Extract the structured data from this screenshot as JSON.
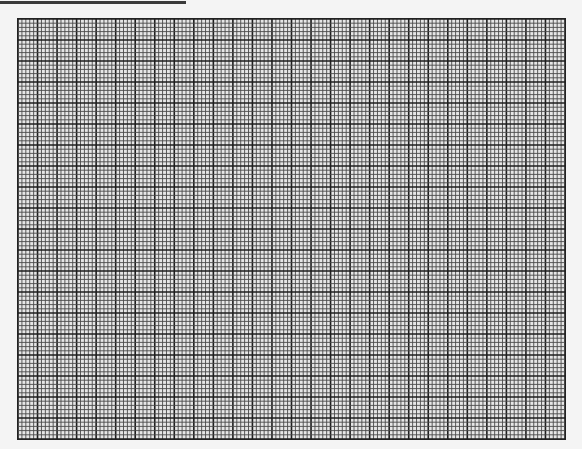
{
  "page": {
    "top_rule": {
      "color": "#3a3a3a"
    },
    "grid": {
      "major_columns": 28,
      "major_rows": 20,
      "subdivisions": 5,
      "major_line_color": "#1e1e1e",
      "minor_line_color": "#4a4a4a",
      "background": "#e6e6e6"
    }
  }
}
